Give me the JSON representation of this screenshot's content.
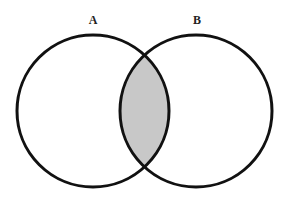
{
  "diagram": {
    "type": "venn",
    "sets": [
      {
        "label": "A",
        "cx": 93,
        "cy": 111,
        "r": 76
      },
      {
        "label": "B",
        "cx": 196,
        "cy": 111,
        "r": 76
      }
    ],
    "highlighted_region": "A ∩ B",
    "colors": {
      "stroke": "#111111",
      "intersection_fill": "#c8c8c8",
      "background": "#ffffff"
    }
  }
}
